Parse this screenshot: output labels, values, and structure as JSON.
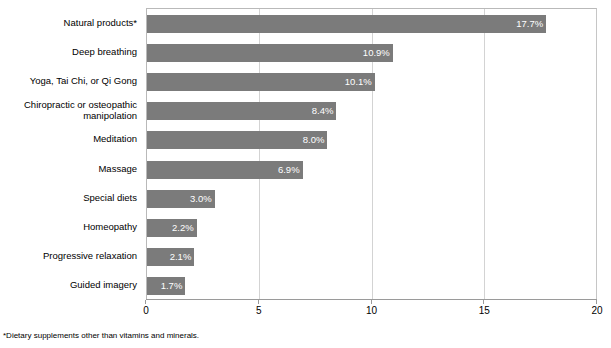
{
  "chart_data": {
    "type": "bar",
    "orientation": "horizontal",
    "title": "",
    "subtitle": "",
    "xlabel": "",
    "ylabel": "",
    "xlim": [
      0,
      20
    ],
    "ylim": null,
    "grid": true,
    "gridlines_axis": "x",
    "legend": false,
    "legend_position": "none",
    "xticks": [
      "0",
      "5",
      "10",
      "15",
      "20"
    ],
    "xtick_values": [
      0,
      5,
      10,
      15,
      20
    ],
    "categories": [
      "Natural products*",
      "Deep breathing",
      "Yoga, Tai Chi, or Qi Gong",
      "Chiropractic or osteopathic manipolation",
      "Meditation",
      "Massage",
      "Special diets",
      "Homeopathy",
      "Progressive relaxation",
      "Guided imagery"
    ],
    "values": [
      17.7,
      10.9,
      10.1,
      8.4,
      8.0,
      6.9,
      3.0,
      2.2,
      2.1,
      1.7
    ],
    "data_labels": [
      "17.7%",
      "10.9%",
      "10.1%",
      "8.4%",
      "8.0%",
      "6.9%",
      "3.0%",
      "2.2%",
      "2.1%",
      "1.7%"
    ],
    "series": [
      {
        "name": "",
        "values": [
          17.7,
          10.9,
          10.1,
          8.4,
          8.0,
          6.9,
          3.0,
          2.2,
          2.1,
          1.7
        ],
        "color": "#7b7b7b"
      }
    ],
    "annotations": [
      "*Dietary supplements other than vitamins and minerals."
    ]
  },
  "footnote": "*Dietary supplements other than vitamins and minerals.",
  "colors": {
    "bar": "#7b7b7b",
    "gridline": "#d3d3d3",
    "plot_border": "#b9b9b9",
    "axis": "#9a9a9a",
    "background": "#ffffff",
    "label_text": "#000000",
    "value_text": "#ffffff"
  }
}
